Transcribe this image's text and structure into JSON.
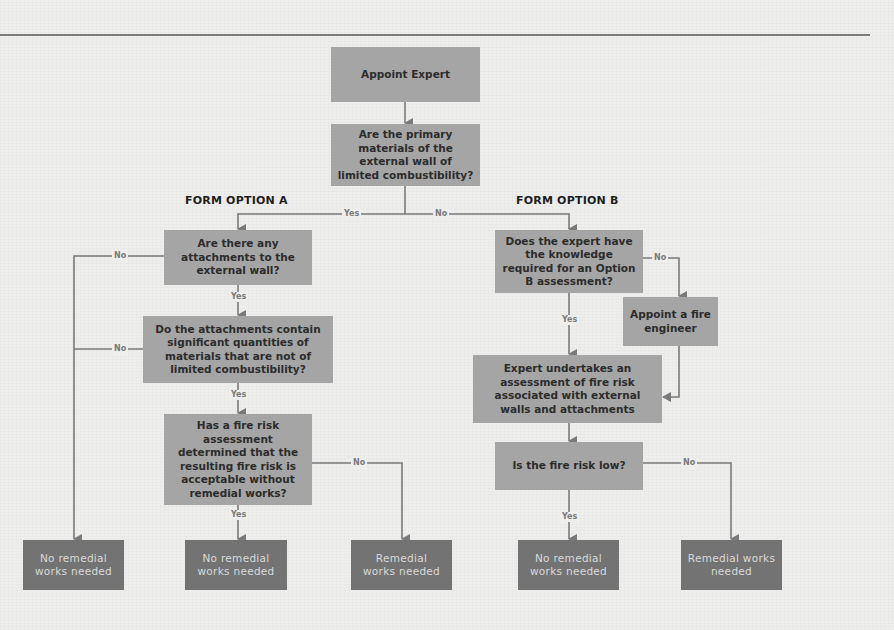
{
  "diagram": {
    "type": "flowchart",
    "column_headers": {
      "option_a": "FORM OPTION A",
      "option_b": "FORM OPTION B"
    },
    "nodes": {
      "appoint_expert": "Appoint Expert",
      "primary_materials": "Are the primary materials of the external wall of limited combustibility?",
      "a_attachments": "Are there any attachments to the external wall?",
      "a_attachments_materials": "Do the attachments contain significant quantities of materials that are not of limited combustibility?",
      "a_fire_risk_assessment": "Has a fire risk assessment determined that the resulting fire risk is acceptable without remedial works?",
      "a_outcome_1": "No remedial works needed",
      "a_outcome_2": "No remedial works needed",
      "a_outcome_3": "Remedial works needed",
      "b_expert_knowledge": "Does the expert have the knowledge required for an Option B assessment?",
      "b_appoint_fire_engineer": "Appoint a fire engineer",
      "b_expert_assessment": "Expert undertakes an assessment of fire risk associated with external walls and attachments",
      "b_fire_risk_low": "Is the fire risk low?",
      "b_outcome_1": "No remedial works needed",
      "b_outcome_2": "Remedial works needed"
    },
    "edge_labels": {
      "primary_yes": "Yes",
      "primary_no": "No",
      "a_attachments_yes": "Yes",
      "a_attachments_no": "No",
      "a_materials_yes": "Yes",
      "a_materials_no": "No",
      "a_assessment_yes": "Yes",
      "a_assessment_no": "No",
      "b_knowledge_yes": "Yes",
      "b_knowledge_no": "No",
      "b_risk_yes": "Yes",
      "b_risk_no": "No"
    },
    "edges": [
      {
        "from": "appoint_expert",
        "to": "primary_materials",
        "label": ""
      },
      {
        "from": "primary_materials",
        "to": "a_attachments",
        "label": "Yes"
      },
      {
        "from": "primary_materials",
        "to": "b_expert_knowledge",
        "label": "No"
      },
      {
        "from": "a_attachments",
        "to": "a_attachments_materials",
        "label": "Yes"
      },
      {
        "from": "a_attachments",
        "to": "a_outcome_1",
        "label": "No"
      },
      {
        "from": "a_attachments_materials",
        "to": "a_fire_risk_assessment",
        "label": "Yes"
      },
      {
        "from": "a_attachments_materials",
        "to": "a_outcome_1",
        "label": "No"
      },
      {
        "from": "a_fire_risk_assessment",
        "to": "a_outcome_2",
        "label": "Yes"
      },
      {
        "from": "a_fire_risk_assessment",
        "to": "a_outcome_3",
        "label": "No"
      },
      {
        "from": "b_expert_knowledge",
        "to": "b_expert_assessment",
        "label": "Yes"
      },
      {
        "from": "b_expert_knowledge",
        "to": "b_appoint_fire_engineer",
        "label": "No"
      },
      {
        "from": "b_appoint_fire_engineer",
        "to": "b_expert_assessment",
        "label": ""
      },
      {
        "from": "b_expert_assessment",
        "to": "b_fire_risk_low",
        "label": ""
      },
      {
        "from": "b_fire_risk_low",
        "to": "b_outcome_1",
        "label": "Yes"
      },
      {
        "from": "b_fire_risk_low",
        "to": "b_outcome_2",
        "label": "No"
      }
    ]
  },
  "colors": {
    "question_box": "#a5a5a5",
    "outcome_box": "#737373",
    "connector": "#7a7a7a",
    "page": "#eeeeec"
  }
}
